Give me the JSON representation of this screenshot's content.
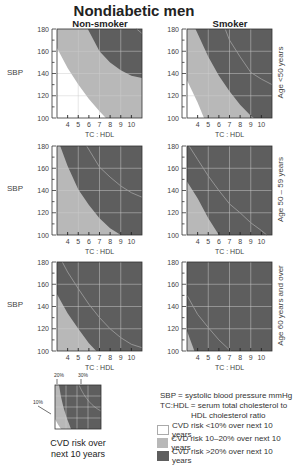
{
  "title": "Nondiabetic men",
  "columns": [
    "Non-smoker",
    "Smoker"
  ],
  "rows": [
    "Age <50 years",
    "Age 50 – 59 years",
    "Age 60 years and over"
  ],
  "y_axis_label": "SBP",
  "x_axis_label": "TC : HDL",
  "y_ticks": [
    "180",
    "160",
    "140",
    "120",
    "100"
  ],
  "x_ticks": [
    "4",
    "5",
    "6",
    "7",
    "8",
    "9",
    "10"
  ],
  "colors": {
    "low": "#ffffff",
    "mid": "#b8b8b8",
    "high": "#5e5e5e",
    "contour": "#9a9a9a",
    "grid": "#cfcfcf"
  },
  "legend": {
    "def1": "SBP = systolic blood pressure mmHg",
    "def2": "TC:HDL = serum total cholesterol to",
    "def3": "HDL cholesterol ratio",
    "items": [
      {
        "label": "CVD risk <10% over next 10 years",
        "color": "#ffffff"
      },
      {
        "label": "CVD risk 10–20% over next 10 years",
        "color": "#b8b8b8"
      },
      {
        "label": "CVD risk >20% over next 10 years",
        "color": "#5e5e5e"
      }
    ]
  },
  "mini": {
    "label_10": "10%",
    "label_20": "20%",
    "label_30": "30%",
    "caption1": "CVD risk over",
    "caption2": "next 10 years"
  },
  "chart_data": {
    "type": "heatmap",
    "title": "Nondiabetic men",
    "xlabel": "TC : HDL",
    "ylabel": "SBP",
    "xlim": [
      3,
      11
    ],
    "ylim": [
      100,
      180
    ],
    "x_ticks": [
      4,
      5,
      6,
      7,
      8,
      9,
      10
    ],
    "y_ticks": [
      100,
      120,
      140,
      160,
      180
    ],
    "grid": true,
    "zones": [
      "<10%",
      "10–20%",
      ">20%"
    ],
    "contours_note": "Boundary curves give approximate (TC:HDL, SBP) points where 10-year CVD risk equals 10%, 20% and 30%",
    "panels": [
      {
        "column": "Non-smoker",
        "row": "Age <50 years",
        "boundary_10": [
          [
            3,
            163
          ],
          [
            4,
            145
          ],
          [
            5,
            130
          ],
          [
            6,
            117
          ],
          [
            7,
            106
          ],
          [
            7.6,
            100
          ]
        ],
        "boundary_20": [
          [
            5.9,
            180
          ],
          [
            7,
            160
          ],
          [
            8,
            150
          ],
          [
            9,
            143
          ],
          [
            10,
            138
          ],
          [
            11,
            136
          ]
        ],
        "boundary_30": [
          [
            10.5,
            180
          ],
          [
            11,
            176
          ]
        ]
      },
      {
        "column": "Smoker",
        "row": "Age <50 years",
        "boundary_10": [
          [
            3,
            134
          ],
          [
            4,
            114
          ],
          [
            4.6,
            100
          ]
        ],
        "boundary_20": [
          [
            3.8,
            180
          ],
          [
            5,
            155
          ],
          [
            6,
            138
          ],
          [
            7,
            124
          ],
          [
            8,
            112
          ],
          [
            9,
            102
          ],
          [
            9.3,
            100
          ]
        ],
        "boundary_30": [
          [
            6.6,
            180
          ],
          [
            7,
            170
          ],
          [
            8,
            155
          ],
          [
            9,
            141
          ],
          [
            10,
            135
          ],
          [
            11,
            130
          ]
        ]
      },
      {
        "column": "Non-smoker",
        "row": "Age 50 – 59 years",
        "boundary_10": [],
        "boundary_20": [
          [
            3.3,
            180
          ],
          [
            4,
            162
          ],
          [
            5,
            141
          ],
          [
            6,
            127
          ],
          [
            7,
            115
          ],
          [
            8,
            106
          ],
          [
            9,
            100
          ]
        ],
        "boundary_30": [
          [
            5.8,
            180
          ],
          [
            7,
            161
          ],
          [
            8,
            152
          ],
          [
            9,
            144
          ],
          [
            10,
            138
          ],
          [
            11,
            134
          ]
        ]
      },
      {
        "column": "Smoker",
        "row": "Age 50 – 59 years",
        "boundary_10": [],
        "boundary_20": [
          [
            3,
            148
          ],
          [
            4,
            133
          ],
          [
            5,
            115
          ],
          [
            6,
            100
          ]
        ],
        "boundary_30": [
          [
            3.2,
            180
          ],
          [
            4,
            168
          ],
          [
            5,
            153
          ],
          [
            6,
            140
          ],
          [
            7,
            128
          ],
          [
            8,
            120
          ],
          [
            9,
            111
          ],
          [
            10,
            104
          ],
          [
            10.5,
            100
          ]
        ]
      },
      {
        "column": "Non-smoker",
        "row": "Age 60 years and over",
        "boundary_10": [],
        "boundary_20": [
          [
            3,
            151
          ],
          [
            4,
            134
          ],
          [
            5,
            120
          ],
          [
            6,
            107
          ],
          [
            6.7,
            100
          ]
        ],
        "boundary_30": [
          [
            3.5,
            180
          ],
          [
            4,
            171
          ],
          [
            5,
            156
          ],
          [
            6,
            142
          ],
          [
            7,
            130
          ],
          [
            8,
            120
          ],
          [
            9,
            112
          ],
          [
            10,
            106
          ],
          [
            11,
            103
          ]
        ]
      },
      {
        "column": "Smoker",
        "row": "Age 60 years and over",
        "boundary_10": [],
        "boundary_20": [
          [
            3,
            118
          ],
          [
            3.7,
            100
          ]
        ],
        "boundary_30": [
          [
            3,
            150
          ],
          [
            4,
            133
          ],
          [
            5,
            121
          ],
          [
            6,
            110
          ],
          [
            7,
            101
          ],
          [
            7.1,
            100
          ]
        ]
      }
    ]
  }
}
